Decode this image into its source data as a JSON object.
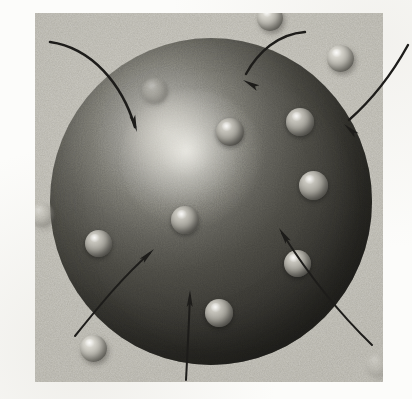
{
  "figure": {
    "kind": "diagram-illustration",
    "caption": "",
    "panel": {
      "x": 35,
      "y": 13,
      "width": 348,
      "height": 369,
      "background_color": "#c7c5bd"
    },
    "page_background_color": "#fcfcfa"
  },
  "big_sphere": {
    "name": "large-sphere",
    "center_x": 211,
    "center_y": 201,
    "radius": 161,
    "highlight_x": 165,
    "highlight_y": 130,
    "highlight_color": "#efeee8",
    "mid_color": "#77766f",
    "shadow_color": "#2a2926",
    "label": ""
  },
  "mini_spheres": [
    {
      "name": "mini-sphere-inner-1",
      "x": 155,
      "y": 91,
      "d": 26,
      "zone": "on-dark",
      "dim": "faint"
    },
    {
      "name": "mini-sphere-inner-2",
      "x": 230,
      "y": 132,
      "d": 28,
      "zone": "on-dark",
      "dim": "none"
    },
    {
      "name": "mini-sphere-inner-3",
      "x": 300,
      "y": 122,
      "d": 28,
      "zone": "on-dark",
      "dim": "none"
    },
    {
      "name": "mini-sphere-inner-4",
      "x": 313,
      "y": 185,
      "d": 29,
      "zone": "on-dark",
      "dim": "none"
    },
    {
      "name": "mini-sphere-inner-5",
      "x": 185,
      "y": 220,
      "d": 28,
      "zone": "on-dark",
      "dim": "none"
    },
    {
      "name": "mini-sphere-inner-6",
      "x": 98,
      "y": 243,
      "d": 27,
      "zone": "on-dark",
      "dim": "none"
    },
    {
      "name": "mini-sphere-inner-7",
      "x": 297,
      "y": 263,
      "d": 27,
      "zone": "on-dark",
      "dim": "none"
    },
    {
      "name": "mini-sphere-inner-8",
      "x": 219,
      "y": 313,
      "d": 28,
      "zone": "on-dark",
      "dim": "none"
    },
    {
      "name": "mini-sphere-outer-top",
      "x": 270,
      "y": 18,
      "d": 26,
      "zone": "on-light",
      "dim": "none"
    },
    {
      "name": "mini-sphere-outer-right",
      "x": 340,
      "y": 58,
      "d": 27,
      "zone": "on-light",
      "dim": "none"
    },
    {
      "name": "mini-sphere-outer-left",
      "x": 42,
      "y": 215,
      "d": 24,
      "zone": "on-light",
      "dim": "faint"
    },
    {
      "name": "mini-sphere-outer-bottom",
      "x": 93,
      "y": 348,
      "d": 27,
      "zone": "on-light",
      "dim": "none"
    },
    {
      "name": "mini-sphere-outer-corner",
      "x": 378,
      "y": 365,
      "d": 24,
      "zone": "on-light",
      "dim": "vfaint"
    }
  ],
  "arrows": [
    {
      "name": "arrow-top-left",
      "path": "M 50 42 C 92 48 122 84 135 127",
      "head_x": 137,
      "head_y": 132,
      "head_angle": 74,
      "width": 2.6,
      "label": ""
    },
    {
      "name": "arrow-top-middle",
      "path": "M 305 32 C 278 34 258 52 246 74",
      "head_x": 243,
      "head_y": 80,
      "head_angle": 208,
      "width": 2.4,
      "label": ""
    },
    {
      "name": "arrow-top-right",
      "path": "M 408 45 C 392 74 374 98 349 120",
      "head_x": 344,
      "head_y": 124,
      "head_angle": 222,
      "width": 2.4,
      "label": ""
    },
    {
      "name": "arrow-bottom-left",
      "path": "M 75 336 C 104 300 124 276 150 253",
      "head_x": 154,
      "head_y": 249,
      "head_angle": 316,
      "width": 2.0,
      "label": ""
    },
    {
      "name": "arrow-bottom-middle",
      "path": "M 186 380 C 188 344 189 320 190 296",
      "head_x": 190,
      "head_y": 290,
      "head_angle": 271,
      "width": 2.0,
      "label": ""
    },
    {
      "name": "arrow-bottom-right",
      "path": "M 372 345 C 342 316 312 280 282 233",
      "head_x": 279,
      "head_y": 228,
      "head_angle": 237,
      "width": 2.0,
      "label": ""
    }
  ]
}
